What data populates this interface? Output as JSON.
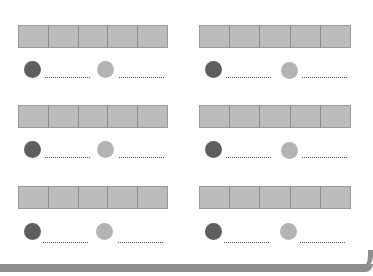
{
  "worksheet": {
    "groups": [
      {
        "id": "g1",
        "cells": 5,
        "dots": [
          {
            "shade": "dark",
            "answer": ""
          },
          {
            "shade": "light",
            "answer": ""
          }
        ]
      },
      {
        "id": "g2",
        "cells": 5,
        "dots": [
          {
            "shade": "dark",
            "answer": ""
          },
          {
            "shade": "light",
            "answer": ""
          }
        ]
      },
      {
        "id": "g3",
        "cells": 5,
        "dots": [
          {
            "shade": "dark",
            "answer": ""
          },
          {
            "shade": "light",
            "answer": ""
          }
        ]
      },
      {
        "id": "g4",
        "cells": 5,
        "dots": [
          {
            "shade": "dark",
            "answer": ""
          },
          {
            "shade": "light",
            "answer": ""
          }
        ]
      },
      {
        "id": "g5",
        "cells": 5,
        "dots": [
          {
            "shade": "dark",
            "answer": ""
          },
          {
            "shade": "light",
            "answer": ""
          }
        ]
      },
      {
        "id": "g6",
        "cells": 5,
        "dots": [
          {
            "shade": "dark",
            "answer": ""
          },
          {
            "shade": "light",
            "answer": ""
          }
        ]
      }
    ],
    "colors": {
      "cell_fill": "#bcbcbc",
      "dark_dot": "#5e5e5e",
      "light_dot": "#b3b3b3",
      "border": "#8e8e8e"
    }
  }
}
